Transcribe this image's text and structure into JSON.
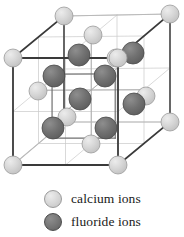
{
  "figure": {
    "background_color": "#ffffff"
  },
  "colors": {
    "calcium_fill": "#cfcfcf",
    "calcium_fill_light": "#e6e6e6",
    "calcium_stroke": "#9a9a9a",
    "fluoride_fill": "#6e6e6e",
    "fluoride_fill_light": "#8c8c8c",
    "fluoride_stroke": "#4a4a4a",
    "edge_dark": "#3a3a3a",
    "edge_light": "#b9b9b9",
    "grid_line": "#c8c8c8",
    "text": "#1a1a1a"
  },
  "lattice": {
    "name": "fluorite-unit-cell",
    "cube_outline": {
      "front_face": [
        {
          "x": 13,
          "y": 58
        },
        {
          "x": 118,
          "y": 58
        },
        {
          "x": 118,
          "y": 165
        },
        {
          "x": 13,
          "y": 165
        }
      ],
      "back_face": [
        {
          "x": 64,
          "y": 16
        },
        {
          "x": 170,
          "y": 14
        },
        {
          "x": 170,
          "y": 122
        },
        {
          "x": 64,
          "y": 122
        }
      ],
      "connectors": [
        [
          {
            "x": 13,
            "y": 58
          },
          {
            "x": 64,
            "y": 16
          }
        ],
        [
          {
            "x": 118,
            "y": 58
          },
          {
            "x": 170,
            "y": 14
          }
        ],
        [
          {
            "x": 118,
            "y": 165
          },
          {
            "x": 170,
            "y": 122
          }
        ],
        [
          {
            "x": 13,
            "y": 165
          },
          {
            "x": 64,
            "y": 122
          }
        ]
      ]
    },
    "calcium_ions": [
      {
        "x": 64,
        "y": 16,
        "r": 9,
        "label": "corner-back-top-left"
      },
      {
        "x": 170,
        "y": 14,
        "r": 9,
        "label": "corner-back-top-right"
      },
      {
        "x": 13,
        "y": 58,
        "r": 9,
        "label": "corner-front-top-left"
      },
      {
        "x": 118,
        "y": 58,
        "r": 9,
        "label": "corner-front-top-right"
      },
      {
        "x": 13,
        "y": 165,
        "r": 9,
        "label": "corner-front-bottom-left"
      },
      {
        "x": 118,
        "y": 165,
        "r": 9,
        "label": "corner-front-bottom-right"
      },
      {
        "x": 170,
        "y": 122,
        "r": 9,
        "label": "corner-back-bottom-right"
      },
      {
        "x": 93,
        "y": 35,
        "r": 9,
        "label": "face-top-center"
      },
      {
        "x": 116,
        "y": 58,
        "r": 9,
        "label": "face-back-upper"
      },
      {
        "x": 38,
        "y": 91,
        "r": 9,
        "label": "face-left-center"
      },
      {
        "x": 146,
        "y": 96,
        "r": 9,
        "label": "face-right-center"
      },
      {
        "x": 67,
        "y": 117,
        "r": 9,
        "label": "face-front-center"
      },
      {
        "x": 91,
        "y": 144,
        "r": 9,
        "label": "face-bottom-center"
      }
    ],
    "fluoride_ions": [
      {
        "x": 79,
        "y": 55,
        "r": 11,
        "label": "interior-1"
      },
      {
        "x": 133,
        "y": 53,
        "r": 11,
        "label": "interior-2"
      },
      {
        "x": 54,
        "y": 76,
        "r": 11,
        "label": "interior-3"
      },
      {
        "x": 105,
        "y": 76,
        "r": 11,
        "label": "interior-4"
      },
      {
        "x": 80,
        "y": 99,
        "r": 11,
        "label": "interior-5"
      },
      {
        "x": 134,
        "y": 104,
        "r": 11,
        "label": "interior-6"
      },
      {
        "x": 53,
        "y": 128,
        "r": 11,
        "label": "interior-7"
      },
      {
        "x": 106,
        "y": 128,
        "r": 11,
        "label": "interior-8"
      }
    ]
  },
  "legend": {
    "items": [
      {
        "label": "calcium ions",
        "swatch": "calcium-ion-swatch",
        "color": "#cfcfcf"
      },
      {
        "label": "fluoride ions",
        "swatch": "fluoride-ion-swatch",
        "color": "#6e6e6e"
      }
    ]
  }
}
